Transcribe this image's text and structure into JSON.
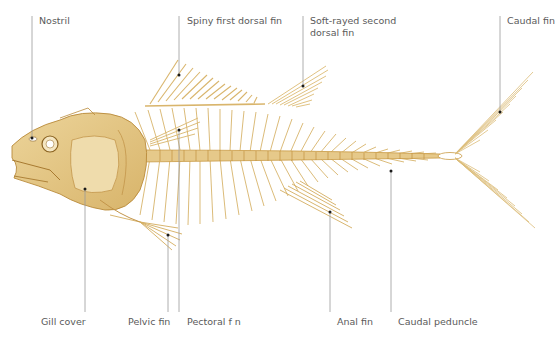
{
  "diagram": {
    "colors": {
      "bone_light": "#f1dfae",
      "bone_mid": "#e2c27d",
      "bone_dark": "#c99b45",
      "leader_line": "#9a9a9a",
      "label_text": "#5a5a5a"
    },
    "labels_top": [
      {
        "id": "nostril",
        "text": "Nostril"
      },
      {
        "id": "spiny-dorsal",
        "text": "Spiny first dorsal fin"
      },
      {
        "id": "soft-dorsal",
        "text": "Soft-rayed second dorsal fin"
      },
      {
        "id": "caudal-fin",
        "text": "Caudal fin"
      }
    ],
    "labels_bottom": [
      {
        "id": "gill-cover",
        "text": "Gill cover"
      },
      {
        "id": "pelvic-fin",
        "text": "Pelvic fin"
      },
      {
        "id": "pectoral-fin",
        "text": "Pectoral f n"
      },
      {
        "id": "anal-fin",
        "text": "Anal fin"
      },
      {
        "id": "caudal-peduncle",
        "text": "Caudal peduncle"
      }
    ]
  }
}
